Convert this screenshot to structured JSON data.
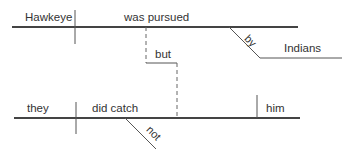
{
  "diagram": {
    "type": "sentence-diagram",
    "clause1": {
      "subject": "Hawkeye",
      "verb": "was pursued",
      "modifier_preposition": "by",
      "modifier_object": "Indians"
    },
    "conjunction": "but",
    "clause2": {
      "subject": "they",
      "verb": "did catch",
      "object": "him",
      "modifier_adverb": "not"
    },
    "colors": {
      "line": "#444444",
      "text": "#333333"
    }
  }
}
